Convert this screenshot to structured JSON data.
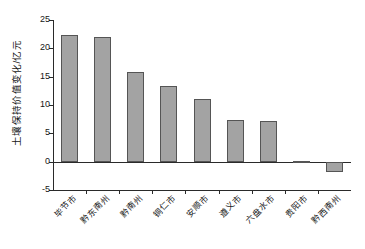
{
  "chart_data": {
    "type": "bar",
    "title": "",
    "subtitle": "",
    "xlabel": "",
    "ylabel": "土壤保持价值变化/亿元",
    "categories": [
      "毕节市",
      "黔东南州",
      "黔南州",
      "铜仁市",
      "安顺市",
      "遵义市",
      "六盘水市",
      "贵阳市",
      "黔西南州"
    ],
    "values": [
      22.3,
      22.0,
      15.9,
      13.4,
      11.1,
      7.4,
      7.2,
      0.2,
      -1.9
    ],
    "series": [
      {
        "name": "土壤保持价值变化",
        "values": [
          22.3,
          22.0,
          15.9,
          13.4,
          11.1,
          7.4,
          7.2,
          0.2,
          -1.9
        ]
      }
    ],
    "ylim": [
      -5,
      25
    ],
    "yticks": [
      -5,
      0,
      5,
      10,
      15,
      20,
      25
    ],
    "ytick_labels": [
      "-5",
      "0",
      "5",
      "10",
      "15",
      "20",
      "25"
    ],
    "grid": false,
    "legend": false,
    "legend_position": "none",
    "bar_fill_color": "#a3a3a3",
    "bar_edge_color": "#555555",
    "axis_color": "#2a2a2a",
    "background_color": "#ffffff",
    "zero_line": 0
  },
  "axis": {
    "y_title": "土壤保持价值变化/亿元"
  }
}
